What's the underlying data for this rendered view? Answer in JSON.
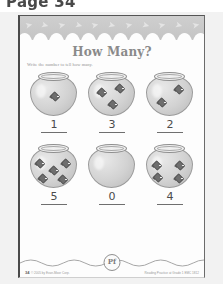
{
  "scan": {
    "page_label": "Page 34",
    "background_color": "#f2f2f2",
    "sheet_color": "#fdfdfd"
  },
  "worksheet": {
    "title": "How Many?",
    "instruction": "Write the number to tell how many.",
    "header_band": {
      "motif_icon": "fish-icon",
      "motif_glyph": "➤",
      "motif_count": 11,
      "band_color": "#c7c7c7"
    },
    "rows": [
      {
        "cells": [
          {
            "bowl_icon": "fishbowl-icon",
            "fish_count": 1,
            "answer": "1"
          },
          {
            "bowl_icon": "fishbowl-icon",
            "fish_count": 3,
            "answer": "3"
          },
          {
            "bowl_icon": "fishbowl-icon",
            "fish_count": 2,
            "answer": "2"
          }
        ]
      },
      {
        "cells": [
          {
            "bowl_icon": "fishbowl-icon",
            "fish_count": 5,
            "answer": "5"
          },
          {
            "bowl_icon": "fishbowl-icon",
            "fish_count": 0,
            "answer": "0"
          },
          {
            "bowl_icon": "fishbowl-icon",
            "fish_count": 4,
            "answer": "4"
          }
        ]
      }
    ],
    "footer": {
      "logo_text": "Pf",
      "logo_icon": "publisher-badge-icon",
      "page_number": "34",
      "copyright": "© 2005 by Evan-Moor Corp.",
      "series_note": "Reading Practice at Grade 1 EMC 1812",
      "divider_icon": "wavy-divider-icon"
    }
  }
}
